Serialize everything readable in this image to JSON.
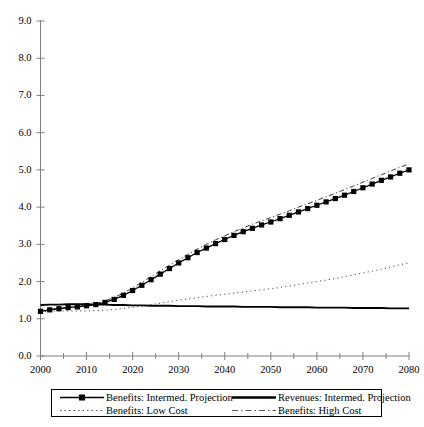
{
  "chart_data": {
    "type": "line",
    "title": "",
    "subtitle": "",
    "xlabel": "",
    "ylabel": "",
    "xlim": [
      2000,
      2080
    ],
    "ylim": [
      0.0,
      9.0
    ],
    "grid": false,
    "legend_position": "bottom",
    "x_tick_labels": [
      "2000",
      "2010",
      "2020",
      "2030",
      "2040",
      "2050",
      "2060",
      "2070",
      "2080"
    ],
    "x_tick_values": [
      2000,
      2010,
      2020,
      2030,
      2040,
      2050,
      2060,
      2070,
      2080
    ],
    "x_minor_tick_values": [
      2005,
      2015,
      2025,
      2035,
      2045,
      2055,
      2065,
      2075
    ],
    "y_tick_labels": [
      "0.0",
      "1.0",
      "2.0",
      "3.0",
      "4.0",
      "5.0",
      "6.0",
      "7.0",
      "8.0",
      "9.0"
    ],
    "y_tick_values": [
      0.0,
      1.0,
      2.0,
      3.0,
      4.0,
      5.0,
      6.0,
      7.0,
      8.0,
      9.0
    ],
    "x": [
      2000,
      2002,
      2004,
      2006,
      2008,
      2010,
      2012,
      2014,
      2016,
      2018,
      2020,
      2022,
      2024,
      2026,
      2028,
      2030,
      2032,
      2034,
      2036,
      2038,
      2040,
      2042,
      2044,
      2046,
      2048,
      2050,
      2052,
      2054,
      2056,
      2058,
      2060,
      2062,
      2064,
      2066,
      2068,
      2070,
      2072,
      2074,
      2076,
      2078,
      2080
    ],
    "series": [
      {
        "name": "Benefits: Intermed. Projection",
        "style": "solid-marker",
        "color": "#000000",
        "values": [
          1.2,
          1.24,
          1.27,
          1.3,
          1.32,
          1.35,
          1.38,
          1.44,
          1.52,
          1.63,
          1.76,
          1.9,
          2.05,
          2.2,
          2.35,
          2.5,
          2.64,
          2.78,
          2.9,
          3.02,
          3.13,
          3.24,
          3.34,
          3.43,
          3.52,
          3.6,
          3.69,
          3.78,
          3.87,
          3.96,
          4.05,
          4.14,
          4.23,
          4.32,
          4.42,
          4.52,
          4.62,
          4.72,
          4.81,
          4.91,
          5.0
        ]
      },
      {
        "name": "Revenues: Intermed. Projection",
        "style": "thick-solid",
        "color": "#000000",
        "values": [
          1.37,
          1.38,
          1.38,
          1.39,
          1.39,
          1.39,
          1.38,
          1.38,
          1.37,
          1.37,
          1.36,
          1.36,
          1.35,
          1.35,
          1.35,
          1.34,
          1.34,
          1.34,
          1.33,
          1.33,
          1.33,
          1.33,
          1.32,
          1.32,
          1.32,
          1.32,
          1.31,
          1.31,
          1.31,
          1.31,
          1.3,
          1.3,
          1.3,
          1.3,
          1.29,
          1.29,
          1.29,
          1.29,
          1.28,
          1.28,
          1.28
        ]
      },
      {
        "name": "Benefits: Low Cost",
        "style": "dotted",
        "color": "#000000",
        "values": [
          1.19,
          1.2,
          1.21,
          1.21,
          1.21,
          1.21,
          1.22,
          1.23,
          1.25,
          1.28,
          1.31,
          1.34,
          1.38,
          1.42,
          1.46,
          1.5,
          1.53,
          1.57,
          1.6,
          1.63,
          1.66,
          1.69,
          1.72,
          1.75,
          1.78,
          1.81,
          1.84,
          1.88,
          1.92,
          1.96,
          2.0,
          2.04,
          2.08,
          2.13,
          2.18,
          2.23,
          2.28,
          2.33,
          2.39,
          2.45,
          2.5
        ]
      },
      {
        "name": "Benefits: High Cost",
        "style": "dashdot",
        "color": "#000000",
        "values": [
          1.21,
          1.25,
          1.28,
          1.31,
          1.34,
          1.37,
          1.41,
          1.48,
          1.57,
          1.69,
          1.83,
          1.98,
          2.13,
          2.29,
          2.44,
          2.59,
          2.73,
          2.87,
          3.0,
          3.12,
          3.23,
          3.34,
          3.44,
          3.54,
          3.63,
          3.72,
          3.81,
          3.9,
          4.0,
          4.09,
          4.18,
          4.28,
          4.37,
          4.47,
          4.57,
          4.67,
          4.77,
          4.87,
          4.97,
          5.07,
          5.16
        ]
      }
    ]
  },
  "legend": {
    "entries": [
      {
        "label": "Benefits: Intermed. Projection",
        "style": "solid-marker"
      },
      {
        "label": "Revenues: Intermed. Projection",
        "style": "thick-solid"
      },
      {
        "label": "Benefits: Low Cost",
        "style": "dotted"
      },
      {
        "label": "Benefits: High Cost",
        "style": "dashdot"
      }
    ]
  },
  "axes": {
    "colors": {
      "axis_line": "#808080",
      "tick": "#808080",
      "series": "#000000"
    }
  }
}
